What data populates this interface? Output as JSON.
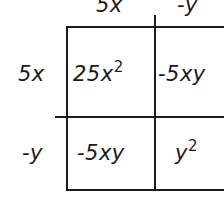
{
  "diagram": {
    "type": "area-model-multiplication",
    "column_headers": [
      "5x",
      "-y"
    ],
    "row_headers": [
      "5x",
      "-y"
    ],
    "cells": [
      [
        {
          "base": "25x",
          "exp": "2"
        },
        {
          "base": "-5xy",
          "exp": ""
        }
      ],
      [
        {
          "base": "-5xy",
          "exp": ""
        },
        {
          "base": "y",
          "exp": "2"
        }
      ]
    ]
  }
}
